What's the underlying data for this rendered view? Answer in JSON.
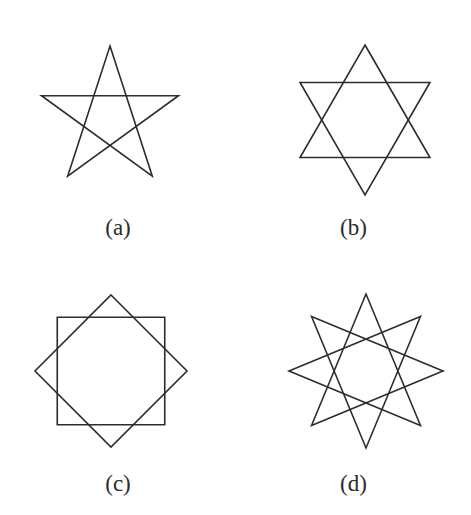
{
  "figure": {
    "background_color": "#ffffff",
    "stroke_color": "#2d2d2d",
    "label_color": "#2b2b2b",
    "stroke_width": 1.6,
    "width": 471,
    "height": 515
  },
  "panels": [
    {
      "id": "a",
      "label": "(a)",
      "shape_name": "pentagram",
      "schlafli": "{5/2}",
      "points": 5,
      "step": 2,
      "continuous": true,
      "center": {
        "x": 110,
        "y": 118
      },
      "radius": 72,
      "rotation_deg": -90,
      "subpaths": 1
    },
    {
      "id": "b",
      "label": "(b)",
      "shape_name": "hexagram",
      "schlafli": "{6/2}",
      "points": 6,
      "step": 2,
      "continuous": false,
      "center": {
        "x": 129,
        "y": 120
      },
      "radius": 75,
      "rotation_deg": -90,
      "subpaths": 2
    },
    {
      "id": "c",
      "label": "(c)",
      "shape_name": "octagram",
      "schlafli": "{8/2}",
      "points": 8,
      "step": 2,
      "continuous": false,
      "center": {
        "x": 111,
        "y": 113
      },
      "radius": 76,
      "rotation_deg": -90,
      "subpaths": 2
    },
    {
      "id": "d",
      "label": "(d)",
      "shape_name": "star-polygon-8-3",
      "schlafli": "{8/3}",
      "points": 8,
      "step": 3,
      "continuous": true,
      "center": {
        "x": 130,
        "y": 113
      },
      "radius": 77,
      "rotation_deg": -90,
      "subpaths": 1
    }
  ]
}
